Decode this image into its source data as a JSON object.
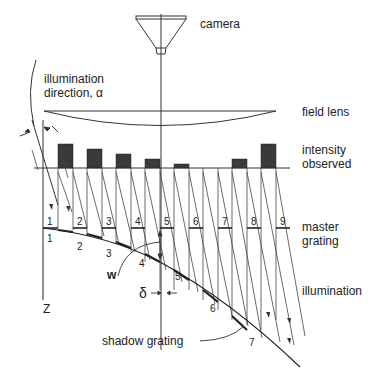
{
  "diagram": {
    "labels": {
      "camera": "camera",
      "illumination_direction_line1": "illumination",
      "illumination_direction_line2": "direction, α",
      "field_lens": "field lens",
      "intensity_line1": "intensity",
      "intensity_line2": "observed",
      "master_line1": "master",
      "master_line2": "grating",
      "illumination": "illumination",
      "shadow_grating": "shadow grating",
      "w": "w",
      "delta": "δ",
      "z": "Z"
    },
    "master_grating_numbers": [
      "1",
      "2",
      "3",
      "4",
      "5",
      "6",
      "7",
      "8",
      "9"
    ],
    "shadow_grating_numbers": [
      "1",
      "2",
      "3",
      "4",
      "5",
      "6",
      "7"
    ],
    "intensity_bars": [
      {
        "slot": 1,
        "height": 24
      },
      {
        "slot": 2,
        "height": 19
      },
      {
        "slot": 3,
        "height": 14
      },
      {
        "slot": 4,
        "height": 9
      },
      {
        "slot": 5,
        "height": 5
      },
      {
        "slot": 6,
        "height": 0
      },
      {
        "slot": 7,
        "height": 0
      },
      {
        "slot": 8,
        "height": 9
      },
      {
        "slot": 9,
        "height": 24
      }
    ],
    "colors": {
      "line": "#333333",
      "bar_fill": "#3a3a3a",
      "background": "#ffffff"
    }
  }
}
